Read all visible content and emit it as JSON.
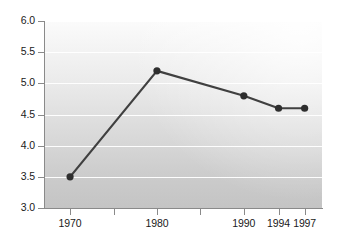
{
  "chart_data": {
    "type": "line",
    "title": "",
    "subtitle": "",
    "xlabel": "",
    "ylabel": "",
    "x": [
      1970,
      1980,
      1990,
      1994,
      1997
    ],
    "categories": [
      "1970",
      "1980",
      "1990",
      "1994",
      "1997"
    ],
    "values": [
      3.5,
      5.2,
      4.8,
      4.6,
      4.6
    ],
    "series": [
      {
        "name": "",
        "values": [
          3.5,
          5.2,
          4.8,
          4.6,
          4.6
        ]
      }
    ],
    "ylim": [
      3.0,
      6.0
    ],
    "xlim": [
      1967,
      1999
    ],
    "y_ticks": [
      3.0,
      3.5,
      4.0,
      4.5,
      5.0,
      5.5,
      6.0
    ],
    "y_tick_labels": [
      "3.0",
      "3.5",
      "4.0",
      "4.5",
      "5.0",
      "5.5",
      "6.0"
    ],
    "x_ticks": [
      1970,
      1975,
      1980,
      1985,
      1990,
      1994,
      1997
    ],
    "x_tick_labels": [
      "1970",
      "",
      "1980",
      "",
      "1990",
      "1994",
      "1997"
    ],
    "grid": true,
    "grid_color": "#ffffff",
    "legend": false,
    "legend_position": "none",
    "line_color": "#404040",
    "marker_color": "#2e2e2e",
    "marker": "circle",
    "axis_color": "#8a8a8a",
    "plot_background_top": "#fbfbfb",
    "plot_background_bottom": "#c4c4c4",
    "page_background": "#ffffff",
    "annotations": []
  },
  "axes": {
    "y_labels": [
      "6.0",
      "5.5",
      "5.0",
      "4.5",
      "4.0",
      "3.5",
      "3.0"
    ],
    "x_labels": [
      "1970",
      "1980",
      "1990",
      "1994",
      "1997"
    ]
  }
}
